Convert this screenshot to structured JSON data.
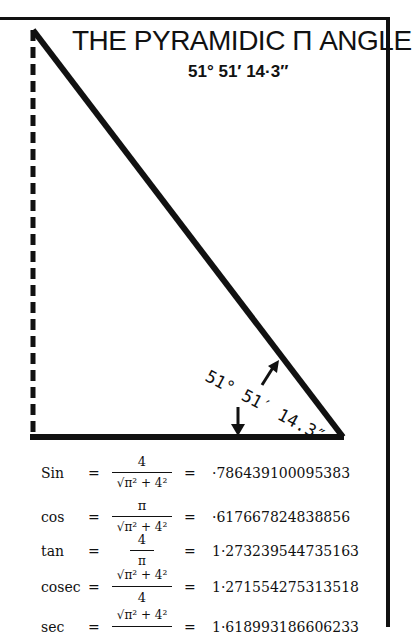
{
  "title": "THE PYRAMIDIC Π ANGLE",
  "subtitle": "51°  51′  14·3″",
  "angle_label": "51° 51′ 14.3″",
  "colors": {
    "ink": "#111111",
    "background": "#ffffff"
  },
  "formulas": [
    {
      "fn": "Sin",
      "eq": "=",
      "num": "4",
      "den": "√π² + 4²",
      "eq2": "=",
      "value": "·786439100095383"
    },
    {
      "fn": "cos",
      "eq": "=",
      "num": "π",
      "den": "√π² + 4²",
      "eq2": "=",
      "value": "·617667824838856"
    },
    {
      "fn": "tan",
      "eq": "=",
      "num": "4",
      "den": "π",
      "eq2": "=",
      "value": "1·273239544735163"
    },
    {
      "fn": "cosec",
      "eq": "=",
      "num": "√π² + 4²",
      "den": "4",
      "eq2": "=",
      "value": "1·271554275313518"
    },
    {
      "fn": "sec",
      "eq": "=",
      "num": "√π² + 4²",
      "den": "",
      "eq2": "=",
      "value": "1·618993186606233"
    }
  ]
}
